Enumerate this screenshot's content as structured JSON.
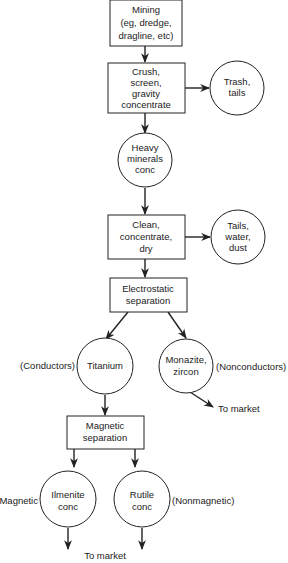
{
  "diagram": {
    "type": "flowchart",
    "colors": {
      "stroke": "#222222",
      "background": "#ffffff",
      "text": "#222222"
    },
    "nodes": {
      "mining": {
        "shape": "box",
        "lines": [
          "Mining",
          "(eg, dredge,",
          "dragline, etc)"
        ]
      },
      "crush": {
        "shape": "box",
        "lines": [
          "Crush,",
          "screen,",
          "gravity",
          "concentrate"
        ]
      },
      "trash": {
        "shape": "circle",
        "lines": [
          "Trash,",
          "tails"
        ]
      },
      "heavy": {
        "shape": "circle",
        "lines": [
          "Heavy",
          "minerals",
          "conc"
        ]
      },
      "clean": {
        "shape": "box",
        "lines": [
          "Clean,",
          "concentrate,",
          "dry"
        ]
      },
      "tails_water": {
        "shape": "circle",
        "lines": [
          "Tails,",
          "water,",
          "dust"
        ]
      },
      "electro": {
        "shape": "box",
        "lines": [
          "Electrostatic",
          "separation"
        ]
      },
      "titanium": {
        "shape": "circle",
        "lines": [
          "Titanium"
        ]
      },
      "monazite": {
        "shape": "circle",
        "lines": [
          "Monazite,",
          "zircon"
        ]
      },
      "magnetic_sep": {
        "shape": "box",
        "lines": [
          "Magnetic",
          "separation"
        ]
      },
      "ilmenite": {
        "shape": "circle",
        "lines": [
          "Ilmenite",
          "conc"
        ]
      },
      "rutile": {
        "shape": "circle",
        "lines": [
          "Rutile",
          "conc"
        ]
      }
    },
    "labels": {
      "conductors": "(Conductors)",
      "nonconductors": "(Nonconductors)",
      "to_market_monazite": "To market",
      "magnetic": "Magnetic",
      "nonmagnetic": "(Nonmagnetic)",
      "to_market_bottom": "To market"
    },
    "edges": [
      {
        "from": "mining",
        "to": "crush"
      },
      {
        "from": "crush",
        "to": "trash"
      },
      {
        "from": "crush",
        "to": "heavy"
      },
      {
        "from": "heavy",
        "to": "clean"
      },
      {
        "from": "clean",
        "to": "tails_water"
      },
      {
        "from": "clean",
        "to": "electro"
      },
      {
        "from": "electro",
        "to": "titanium"
      },
      {
        "from": "electro",
        "to": "monazite"
      },
      {
        "from": "monazite",
        "to": "to_market_monazite"
      },
      {
        "from": "titanium",
        "to": "magnetic_sep"
      },
      {
        "from": "magnetic_sep",
        "to": "ilmenite"
      },
      {
        "from": "magnetic_sep",
        "to": "rutile"
      },
      {
        "from": "ilmenite",
        "to": "to_market_bottom"
      },
      {
        "from": "rutile",
        "to": "to_market_bottom"
      }
    ]
  }
}
